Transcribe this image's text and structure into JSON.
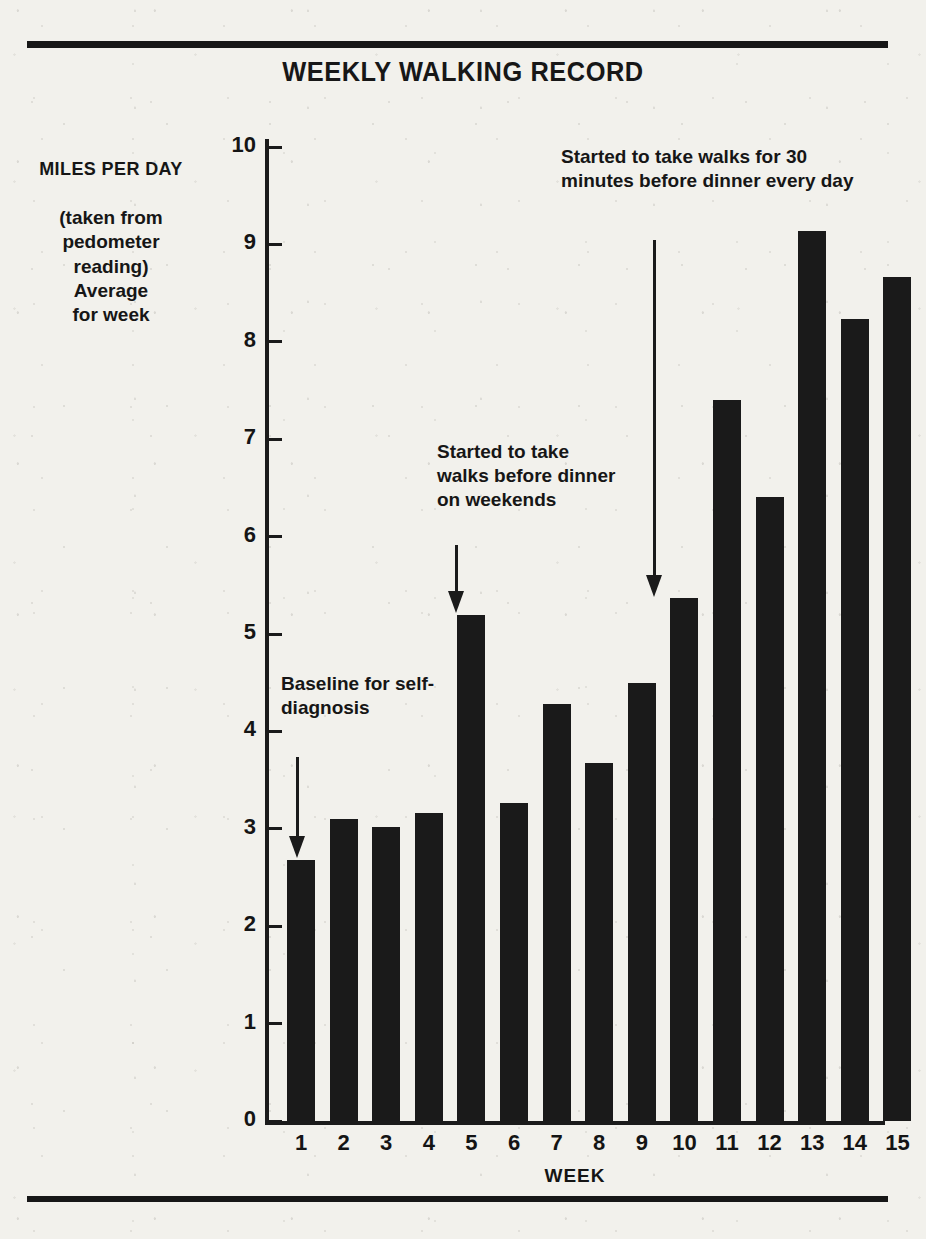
{
  "chart_data": {
    "type": "bar",
    "title": "WEEKLY WALKING RECORD",
    "xlabel": "WEEK",
    "ylabel": "MILES PER DAY",
    "ylabel_note": "(taken from pedometer reading) Average for week",
    "categories": [
      "1",
      "2",
      "3",
      "4",
      "5",
      "6",
      "7",
      "8",
      "9",
      "10",
      "11",
      "12",
      "13",
      "14",
      "15"
    ],
    "values": [
      2.68,
      3.1,
      3.02,
      3.16,
      5.2,
      3.27,
      4.28,
      3.68,
      4.5,
      5.37,
      7.4,
      6.41,
      9.14,
      8.23,
      8.67
    ],
    "ylim": [
      0,
      10
    ],
    "yticks": [
      0,
      1,
      2,
      3,
      4,
      5,
      6,
      7,
      8,
      9,
      10
    ],
    "ytick_labels": [
      "0",
      "1",
      "2",
      "3",
      "4",
      "5",
      "6",
      "7",
      "8",
      "9",
      "10"
    ],
    "grid": false,
    "legend": "none",
    "bar_color": "#1a1a1a",
    "background_color": "#f2f1ec",
    "annotations": [
      {
        "id": "baseline",
        "text": "Baseline for self-diagnosis",
        "target_week": 1
      },
      {
        "id": "weekend-walks",
        "text": "Started to take walks before dinner on weekends",
        "target_week": 5
      },
      {
        "id": "daily-walks",
        "text": "Started to take walks for 30 minutes before dinner every day",
        "target_week": 10
      }
    ]
  },
  "chart": {
    "title": "WEEKLY WALKING RECORD",
    "y_axis_title": "MILES PER DAY",
    "y_axis_subtitle": "(taken from pedometer reading) Average for week",
    "x_axis_title": "WEEK"
  },
  "annotations": {
    "baseline": "Baseline for self-diagnosis",
    "weekend": "Started to take walks before dinner on weekends",
    "daily": "Started to take walks for 30 minutes before dinner every day"
  }
}
